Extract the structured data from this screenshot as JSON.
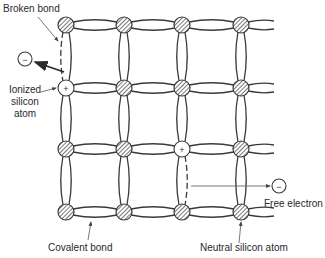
{
  "diagram": {
    "grid": {
      "columns_x": [
        66,
        124,
        182,
        241
      ],
      "rows_y": [
        25,
        88,
        149,
        212
      ],
      "atom_radius": 8
    },
    "atoms": [
      {
        "row": 0,
        "col": 0,
        "type": "neutral"
      },
      {
        "row": 0,
        "col": 1,
        "type": "neutral"
      },
      {
        "row": 0,
        "col": 2,
        "type": "neutral"
      },
      {
        "row": 0,
        "col": 3,
        "type": "neutral"
      },
      {
        "row": 1,
        "col": 0,
        "type": "ionized",
        "sign": "+"
      },
      {
        "row": 1,
        "col": 1,
        "type": "neutral"
      },
      {
        "row": 1,
        "col": 2,
        "type": "neutral"
      },
      {
        "row": 1,
        "col": 3,
        "type": "neutral"
      },
      {
        "row": 2,
        "col": 0,
        "type": "neutral"
      },
      {
        "row": 2,
        "col": 1,
        "type": "neutral"
      },
      {
        "row": 2,
        "col": 2,
        "type": "ionized",
        "sign": "+"
      },
      {
        "row": 2,
        "col": 3,
        "type": "neutral"
      },
      {
        "row": 3,
        "col": 0,
        "type": "neutral"
      },
      {
        "row": 3,
        "col": 1,
        "type": "neutral"
      },
      {
        "row": 3,
        "col": 2,
        "type": "neutral"
      },
      {
        "row": 3,
        "col": 3,
        "type": "neutral"
      }
    ],
    "broken_bonds": [
      {
        "from": [
          0,
          0
        ],
        "to": [
          1,
          0
        ],
        "side": "left"
      },
      {
        "from": [
          2,
          2
        ],
        "to": [
          3,
          2
        ],
        "side": "right"
      }
    ],
    "electrons": [
      {
        "label": "electron-left",
        "x": 25,
        "y": 59,
        "sign": "−"
      },
      {
        "label": "free-electron",
        "x": 279,
        "y": 186,
        "sign": "−"
      }
    ],
    "labels": {
      "broken_bond": "Broken bond",
      "ionized_line1": "Ionized",
      "ionized_line2": "silicon",
      "ionized_line3": "atom",
      "free_electron": "Free electron",
      "covalent_bond": "Covalent bond",
      "neutral_atom": "Neutral silicon atom"
    },
    "colors": {
      "line": "#3a3a3a",
      "atom_fill": "#9a9a9a",
      "background": "#ffffff"
    }
  }
}
